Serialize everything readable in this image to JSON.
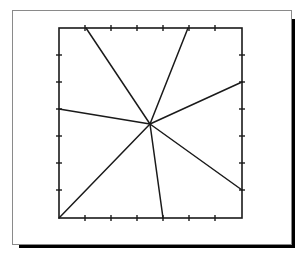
{
  "diagram": {
    "type": "radial-line-star-in-square",
    "panel": {
      "x": 12,
      "y": 10,
      "width": 279,
      "height": 234,
      "border_color": "#8a8a8a",
      "shadow_color": "#000000",
      "shadow_offset": 4
    },
    "frame": {
      "x": 59,
      "y": 28,
      "width": 183,
      "height": 190,
      "stroke": "#1a1a1a",
      "stroke_width": 1.6
    },
    "ticks": {
      "length": 6,
      "top_x": [
        85,
        111,
        137,
        163,
        189,
        215
      ],
      "bottom_x": [
        85,
        111,
        137,
        163,
        189,
        215
      ],
      "left_y": [
        55,
        82,
        109,
        136,
        163,
        190
      ],
      "right_y": [
        55,
        82,
        109,
        136,
        163,
        190
      ]
    },
    "center": {
      "x": 150,
      "y": 124
    },
    "rays": [
      {
        "name": "ray-top-left",
        "x": 86,
        "y": 28
      },
      {
        "name": "ray-top-right",
        "x": 188,
        "y": 28
      },
      {
        "name": "ray-right-upper",
        "x": 242,
        "y": 82
      },
      {
        "name": "ray-right-lower",
        "x": 242,
        "y": 190
      },
      {
        "name": "ray-bottom",
        "x": 163,
        "y": 218
      },
      {
        "name": "ray-bottom-left-corner",
        "x": 59,
        "y": 218
      },
      {
        "name": "ray-left",
        "x": 59,
        "y": 109
      }
    ]
  }
}
